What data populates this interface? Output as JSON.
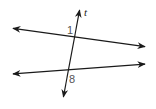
{
  "diagram": {
    "colors": {
      "line": "#1a1a1a",
      "label": "#555555"
    },
    "lines": [
      {
        "name": "line-top",
        "from": [
          11,
          28
        ],
        "to": [
          147,
          47
        ],
        "arrows": "both"
      },
      {
        "name": "line-bottom",
        "from": [
          11,
          74
        ],
        "to": [
          147,
          64
        ],
        "arrows": "both"
      },
      {
        "name": "transversal-t",
        "from": [
          63,
          99
        ],
        "to": [
          80,
          8
        ],
        "arrows": "both"
      }
    ],
    "labels": {
      "transversal": "t",
      "angle_top": "1",
      "angle_bottom": "8"
    }
  }
}
